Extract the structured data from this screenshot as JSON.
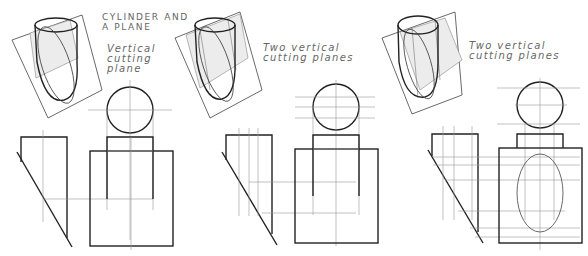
{
  "figure": {
    "header_cropped": "",
    "title": {
      "line1": "CYLINDER AND",
      "line2": "A PLANE"
    },
    "panels": [
      {
        "id": "panel-1",
        "caption": [
          "Vertical",
          "cutting",
          "plane"
        ],
        "cutting_planes": 1,
        "views": [
          "pictorial",
          "top-view-circle",
          "side-view-inclined-plane",
          "front-view-cylinder"
        ]
      },
      {
        "id": "panel-2",
        "caption": [
          "Two vertical",
          "cutting planes"
        ],
        "cutting_planes": 2,
        "views": [
          "pictorial",
          "top-view-circle",
          "side-view-inclined-plane",
          "front-view-cylinder"
        ]
      },
      {
        "id": "panel-3",
        "caption": [
          "Two vertical",
          "cutting planes"
        ],
        "cutting_planes": 2,
        "views": [
          "pictorial",
          "top-view-circle",
          "side-view-inclined-plane",
          "front-view-with-ellipse"
        ]
      }
    ],
    "colors": {
      "object_line": "#222222",
      "construction_line": "#999999",
      "text": "#666666",
      "shade": "#ececec"
    }
  }
}
